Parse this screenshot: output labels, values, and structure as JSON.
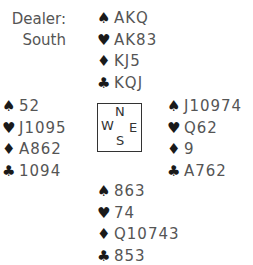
{
  "dealer": {
    "label": "Dealer:",
    "value": "South"
  },
  "suits": {
    "spade": "♠",
    "heart": "♥",
    "diamond": "♦",
    "club": "♣"
  },
  "compass": {
    "N": "N",
    "W": "W",
    "E": "E",
    "S": "S"
  },
  "hands": {
    "north": {
      "spades": "AKQ",
      "hearts": "AK83",
      "diamonds": "KJ5",
      "clubs": "KQJ"
    },
    "west": {
      "spades": "52",
      "hearts": "J1095",
      "diamonds": "A862",
      "clubs": "1094"
    },
    "east": {
      "spades": "J10974",
      "hearts": "Q62",
      "diamonds": "9",
      "clubs": "A762"
    },
    "south": {
      "spades": "863",
      "hearts": "74",
      "diamonds": "Q10743",
      "clubs": "853"
    }
  }
}
